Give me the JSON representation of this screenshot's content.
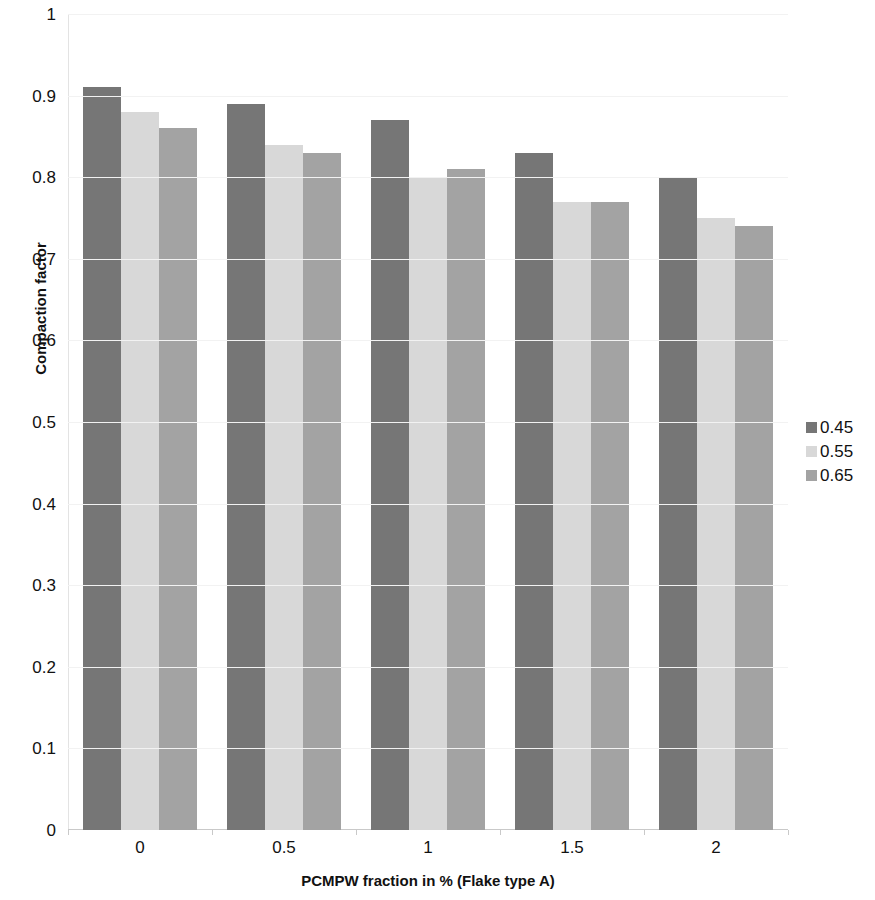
{
  "chart_data": {
    "type": "bar",
    "title": "",
    "xlabel": "PCMPW fraction in % (Flake type A)",
    "ylabel": "Compaction factor",
    "categories": [
      "0",
      "0.5",
      "1",
      "1.5",
      "2"
    ],
    "ylim": [
      0,
      1
    ],
    "yticks": [
      "0",
      "0.1",
      "0.2",
      "0.3",
      "0.4",
      "0.5",
      "0.6",
      "0.7",
      "0.8",
      "0.9",
      "1"
    ],
    "grid": false,
    "legend_position": "right",
    "series": [
      {
        "name": "0.45",
        "color": "#767676",
        "values": [
          0.91,
          0.89,
          0.87,
          0.83,
          0.8
        ]
      },
      {
        "name": "0.55",
        "color": "#d8d8d8",
        "values": [
          0.88,
          0.84,
          0.8,
          0.77,
          0.75
        ]
      },
      {
        "name": "0.65",
        "color": "#a3a3a3",
        "values": [
          0.86,
          0.83,
          0.81,
          0.77,
          0.74
        ]
      }
    ]
  },
  "axes": {
    "y_title": "Compaction factor",
    "x_title": "PCMPW fraction in % (Flake type A)"
  },
  "legend": {
    "items": [
      {
        "label": "0.45",
        "color": "#767676"
      },
      {
        "label": "0.55",
        "color": "#d8d8d8"
      },
      {
        "label": "0.65",
        "color": "#a3a3a3"
      }
    ]
  }
}
